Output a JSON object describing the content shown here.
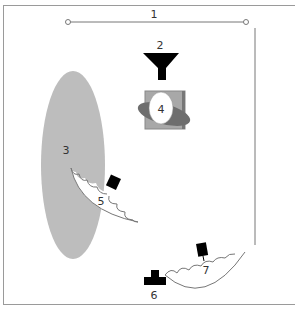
{
  "diagram": {
    "type": "lighting-setup",
    "labels": {
      "backdrop": "1",
      "hair_light": "2",
      "subject": "4",
      "reflector_panel": "3",
      "key_light": "5",
      "camera": "6",
      "fill_light": "7"
    },
    "colors": {
      "frame": "#9a9a9a",
      "panel_fill": "#bdbdbd",
      "subject_box": "#a8a8a8",
      "subject_shadow": "#6e6e6e",
      "ink": "#000000",
      "line": "#777777"
    }
  }
}
